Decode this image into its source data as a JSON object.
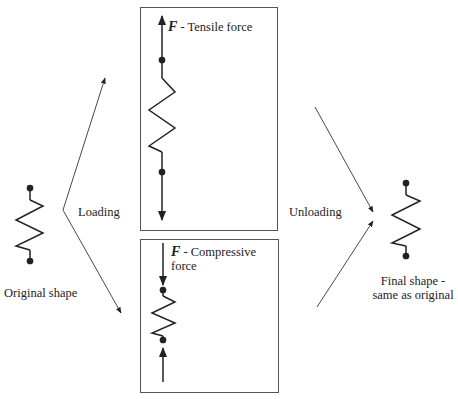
{
  "diagram": {
    "original": {
      "label": "Original shape"
    },
    "loading": {
      "label": "Loading"
    },
    "tensile": {
      "symbol": "F",
      "label": " - Tensile force"
    },
    "compressive": {
      "symbol": "F",
      "label_line1": " - Compressive",
      "label_line2": "force"
    },
    "unloading": {
      "label": "Unloading"
    },
    "final": {
      "label_line1": "Final shape -",
      "label_line2": "same as original"
    }
  },
  "colors": {
    "line": "#222222",
    "box_border": "#555555",
    "background": "#ffffff"
  }
}
